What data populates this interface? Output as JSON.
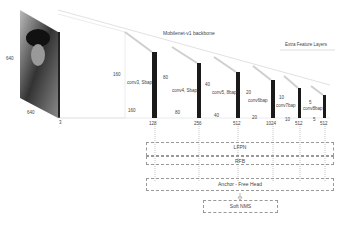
{
  "input": {
    "height": "640",
    "width": "640",
    "channels": "3"
  },
  "backbone": {
    "title": "Mobilenet-v1 backbone"
  },
  "extra": {
    "title": "Extra Feature Layers"
  },
  "stages": [
    {
      "conv": "conv3, Sbap",
      "h": "160",
      "w": "160",
      "c": "128"
    },
    {
      "conv": "conv4, Sbap",
      "h": "80",
      "w": "80",
      "c": "256"
    },
    {
      "conv": "conv5, 8bap",
      "h": "40",
      "w": "40",
      "c": "512"
    },
    {
      "conv": "conv6bap",
      "h": "20",
      "w": "20",
      "c": "1024"
    },
    {
      "conv": "conv7bap",
      "h": "10",
      "w": "10",
      "c": "512"
    },
    {
      "conv": "conv8bap",
      "h": "5",
      "w": "5",
      "c": "512"
    }
  ],
  "modules": {
    "lfpn": "LFPN",
    "rfb": "RFB",
    "head": "Anchor - Free Head",
    "nms": "Soft NMS"
  }
}
